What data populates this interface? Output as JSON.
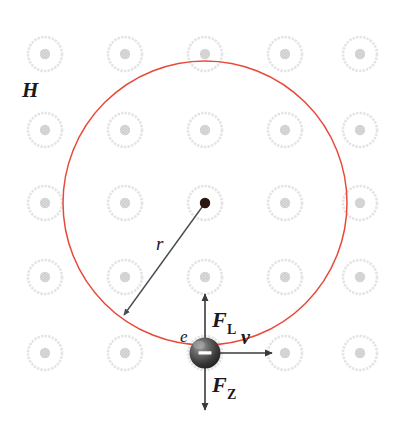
{
  "figure": {
    "background_color": "#ffffff"
  },
  "colors": {
    "orbit": "#e8493a",
    "atom_ring": "#e3e3e3",
    "atom_core": "#d5d5d5",
    "arrow": "#3a3a3a",
    "radius_arrow": "#4a4a52",
    "electron_dark": "#2a2a2a",
    "electron_light": "#b8b8b8",
    "center_dot": "#2b1810",
    "label": "#1a1a1a"
  },
  "labels": {
    "lattice": "H",
    "radius": "r",
    "electron": "e",
    "velocity": "v",
    "force_lorentz_base": "F",
    "force_lorentz_sub": "L",
    "force_centrifugal_base": "F",
    "force_centrifugal_sub": "Z",
    "charge_sign": "–"
  },
  "geometry": {
    "orbit": {
      "cx": 205,
      "cy": 203,
      "r": 142
    },
    "center_dot": {
      "cx": 205,
      "cy": 203,
      "r": 5
    },
    "electron": {
      "cx": 205,
      "cy": 353,
      "r": 16
    },
    "radius_arrow": {
      "x1": 205,
      "y1": 203,
      "x2": 122,
      "y2": 317
    },
    "vertical_arrow": {
      "x": 205,
      "y_top": 294,
      "y_bottom": 410
    },
    "velocity_arrow": {
      "y": 353,
      "x_start": 205,
      "x_end": 274
    }
  },
  "label_positions": {
    "lattice": {
      "x": 22,
      "y": 97
    },
    "radius": {
      "x": 156,
      "y": 250
    },
    "electron": {
      "x": 180,
      "y": 342
    },
    "velocity": {
      "x": 243,
      "y": 344
    },
    "force_lorentz": {
      "x": 212,
      "y": 327
    },
    "force_centrifugal": {
      "x": 212,
      "y": 392
    }
  },
  "lattice": {
    "description": "Array of hydrogen atoms rendered as pale rings with hatched cores",
    "ring_radius": 17,
    "core_radius": 5,
    "columns_x": [
      45,
      125,
      205,
      285,
      360
    ],
    "rows_y": [
      54,
      130,
      203,
      277,
      353
    ],
    "atoms": [
      {
        "cx": 45,
        "cy": 54
      },
      {
        "cx": 125,
        "cy": 54
      },
      {
        "cx": 205,
        "cy": 54
      },
      {
        "cx": 285,
        "cy": 54
      },
      {
        "cx": 360,
        "cy": 54
      },
      {
        "cx": 45,
        "cy": 130
      },
      {
        "cx": 125,
        "cy": 130
      },
      {
        "cx": 205,
        "cy": 130
      },
      {
        "cx": 285,
        "cy": 130
      },
      {
        "cx": 360,
        "cy": 130
      },
      {
        "cx": 45,
        "cy": 203
      },
      {
        "cx": 125,
        "cy": 203
      },
      {
        "cx": 205,
        "cy": 203
      },
      {
        "cx": 285,
        "cy": 203
      },
      {
        "cx": 360,
        "cy": 203
      },
      {
        "cx": 45,
        "cy": 277
      },
      {
        "cx": 125,
        "cy": 277
      },
      {
        "cx": 205,
        "cy": 277
      },
      {
        "cx": 285,
        "cy": 277
      },
      {
        "cx": 360,
        "cy": 277
      },
      {
        "cx": 45,
        "cy": 353
      },
      {
        "cx": 125,
        "cy": 353
      },
      {
        "cx": 205,
        "cy": 353
      },
      {
        "cx": 285,
        "cy": 353
      },
      {
        "cx": 360,
        "cy": 353
      }
    ]
  }
}
